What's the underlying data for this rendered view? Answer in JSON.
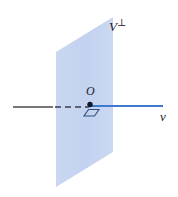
{
  "figure": {
    "type": "geometry-diagram",
    "background_color": "#ffffff"
  },
  "labels": {
    "plane_label_base": "V",
    "plane_label_superscript": "⊥",
    "origin_label": "O",
    "vector_label": "v"
  },
  "colors": {
    "plane_fill": "#c3d2ef",
    "plane_fill_light": "#d3deF4",
    "ray_blue": "#3f7ad1",
    "axis_gray": "#4a4a4a",
    "label_text": "#1a1a2e",
    "marker_stroke": "#2f4f82"
  },
  "geometry": {
    "plane_vertices": "56,187 56,52 113,17 113,152",
    "solid_axis": {
      "x1": 13,
      "y1": 107,
      "x2": 52,
      "y2": 107
    },
    "dashed_axis": {
      "x1": 55,
      "y1": 107,
      "x2": 88,
      "y2": 107,
      "dash": "6 4"
    },
    "blue_ray": {
      "x1": 89,
      "y1": 106,
      "x2": 163,
      "y2": 106
    },
    "origin_point": {
      "cx": 90,
      "cy": 104,
      "r": 2.6
    },
    "right_angle_marker": "84,115 94,115 99,109 89,109"
  }
}
